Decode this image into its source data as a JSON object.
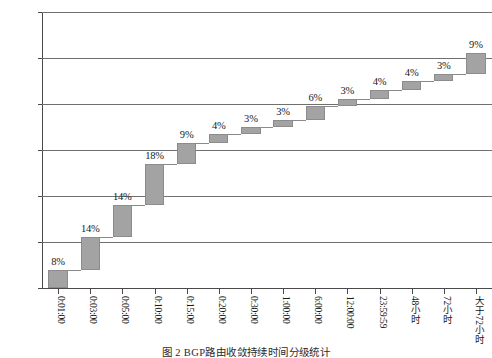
{
  "figure": {
    "caption": "图 2   BGP路由收敛持续时间分级统计"
  },
  "chart_data": {
    "type": "bar",
    "subtype": "waterfall-cumulative",
    "title": "",
    "xlabel": "",
    "ylabel": "",
    "ylim": [
      0,
      120
    ],
    "ytick_labels": [
      "0",
      "20%",
      "40%",
      "60%",
      "80%",
      "100%",
      "120%"
    ],
    "ytick_values": [
      0,
      20,
      40,
      60,
      80,
      100,
      120
    ],
    "grid": true,
    "legend": false,
    "bar_color": "#a3a3a3",
    "categories": [
      "0:01:00",
      "0:03:00",
      "0:05:00",
      "0:10:00",
      "0:15:00",
      "0:20:00",
      "0:30:00",
      "1:00:00",
      "6:00:00",
      "12:00:00",
      "23:59:59",
      "48小时",
      "72小时",
      "大于72小时"
    ],
    "values": [
      8,
      14,
      14,
      18,
      9,
      4,
      3,
      3,
      6,
      3,
      4,
      4,
      3,
      9
    ],
    "data_labels": [
      "8%",
      "14%",
      "14%",
      "18%",
      "9%",
      "4%",
      "3%",
      "3%",
      "6%",
      "3%",
      "4%",
      "4%",
      "3%",
      "9%"
    ],
    "cumulative_start": [
      0,
      8,
      22,
      36,
      54,
      63,
      67,
      70,
      73,
      79,
      82,
      86,
      90,
      93
    ],
    "cumulative_end": [
      8,
      22,
      36,
      54,
      63,
      67,
      70,
      73,
      79,
      82,
      86,
      90,
      93,
      102
    ]
  }
}
